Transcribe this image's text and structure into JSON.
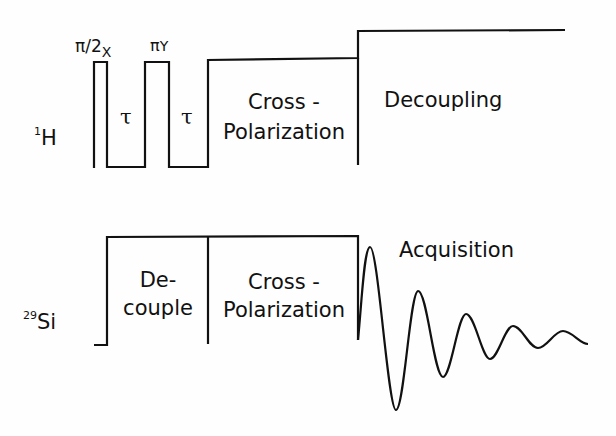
{
  "diagram": {
    "channels": [
      {
        "id": "1H",
        "nucleus_sup": "1",
        "nucleus": "H"
      },
      {
        "id": "29Si",
        "nucleus_sup": "29",
        "nucleus": "Si"
      }
    ],
    "h_labels": {
      "pulse1": "π/2",
      "pulse1_sub": "X",
      "pulse2": "π",
      "pulse2_sub": "Y",
      "tau1": "τ",
      "tau2": "τ",
      "cp_line1": "Cross -",
      "cp_line2": "Polarization",
      "decoupling": "Decoupling"
    },
    "si_labels": {
      "decouple_line1": "De-",
      "decouple_line2": "couple",
      "cp_line1": "Cross -",
      "cp_line2": "Polarization",
      "acquisition": "Acquisition"
    },
    "line_color": "#111111"
  }
}
